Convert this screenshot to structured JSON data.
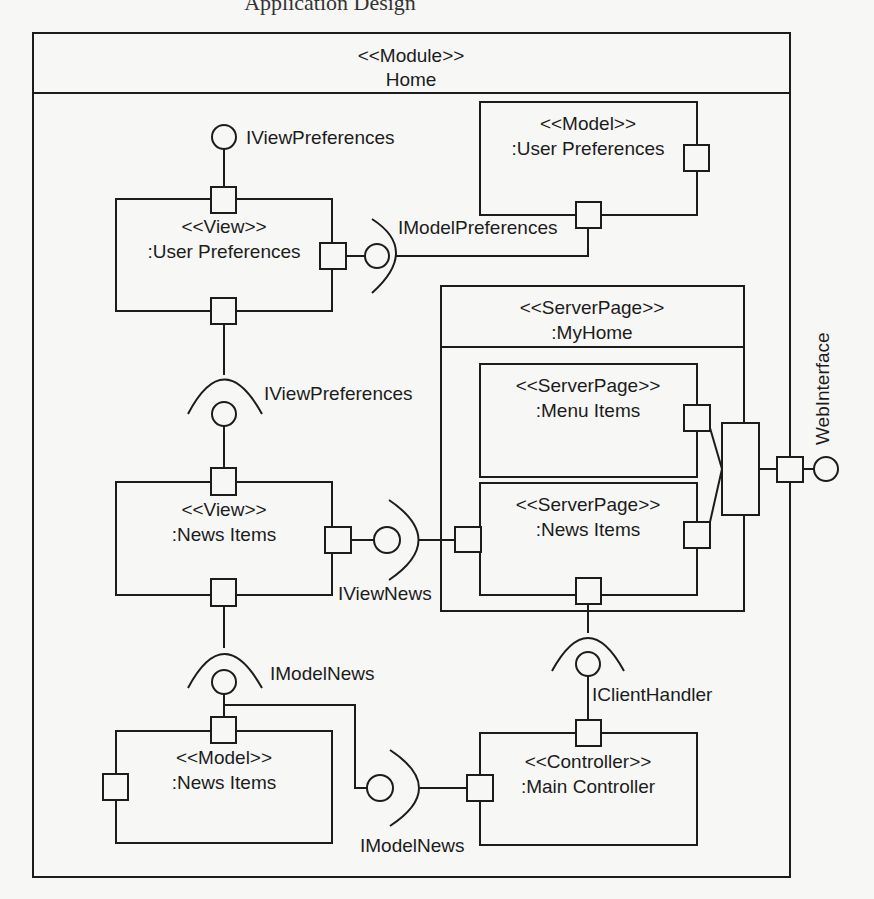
{
  "page": {
    "caption_fragment": "Application Design"
  },
  "module": {
    "stereotype": "<<Module>>",
    "name": "Home"
  },
  "components": {
    "view_user_prefs": {
      "stereotype": "<<View>>",
      "name": ":User Preferences"
    },
    "model_user_prefs": {
      "stereotype": "<<Model>>",
      "name": ":User Preferences"
    },
    "serverpage_myhome": {
      "stereotype": "<<ServerPage>>",
      "name": ":MyHome"
    },
    "serverpage_menu_items": {
      "stereotype": "<<ServerPage>>",
      "name": ":Menu Items"
    },
    "serverpage_news_items": {
      "stereotype": "<<ServerPage>>",
      "name": ":News Items"
    },
    "view_news_items": {
      "stereotype": "<<View>>",
      "name": ":News Items"
    },
    "model_news_items": {
      "stereotype": "<<Model>>",
      "name": ":News Items"
    },
    "main_controller": {
      "stereotype": "<<Controller>>",
      "name": ":Main Controller"
    }
  },
  "interfaces": {
    "iview_preferences_provided": "IViewPreferences",
    "imodel_preferences": "IModelPreferences",
    "iview_preferences_required": "IViewPreferences",
    "iview_news": "IViewNews",
    "imodel_news_upper": "IModelNews",
    "imodel_news_lower": "IModelNews",
    "iclient_handler": "IClientHandler",
    "web_interface": "WebInterface"
  },
  "colors": {
    "line": "#1c1c1c",
    "background": "#f7f7f5"
  }
}
